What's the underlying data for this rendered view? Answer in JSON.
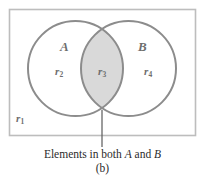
{
  "figure": {
    "label": "(b)",
    "caption_prefix": "Elements in both ",
    "caption_setA": "A",
    "caption_conjunction": " and ",
    "caption_setB": "B"
  },
  "diagram": {
    "type": "venn-two-set",
    "universal_set_label": "r",
    "universal_set_sub": "1",
    "setA_label": "A",
    "setB_label": "B",
    "regions": [
      {
        "name": "r1",
        "base": "r",
        "sub": "1",
        "meaning": "outside both A and B",
        "shaded": false
      },
      {
        "name": "r2",
        "base": "r",
        "sub": "2",
        "meaning": "A only",
        "shaded": false
      },
      {
        "name": "r3",
        "base": "r",
        "sub": "3",
        "meaning": "A intersect B",
        "shaded": true
      },
      {
        "name": "r4",
        "base": "r",
        "sub": "4",
        "meaning": "B only",
        "shaded": false
      }
    ],
    "colors": {
      "rect_stroke": "#bdbdbd",
      "circle_stroke": "#8c8c8c",
      "lens_fill": "#d9d9d9",
      "label_gray": "#6e6e6e",
      "leader_line": "#5a5a5a",
      "caption_text": "#2b2b2b",
      "background": "#ffffff"
    }
  }
}
